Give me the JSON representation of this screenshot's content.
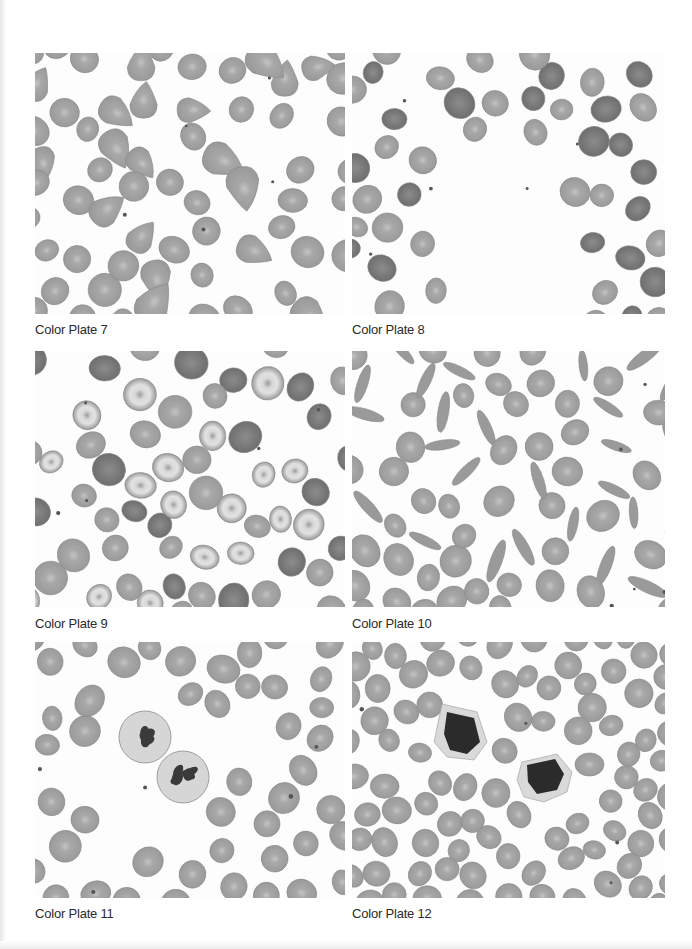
{
  "page": {
    "background": "#ffffff",
    "cell_fill": "#9a9a9a",
    "cell_center": "#c4c4c4",
    "cell_stroke": "#8a8a8a",
    "nucleus_fill": "#3a3a3a"
  },
  "plates": [
    {
      "id": "7",
      "caption": "Color Plate 7",
      "x": 35,
      "y": 53,
      "w": 310,
      "h": 261,
      "cap_y": 322,
      "seed": 7,
      "count": 62,
      "kind": "teardrop"
    },
    {
      "id": "8",
      "caption": "Color Plate 8",
      "x": 352,
      "y": 53,
      "w": 313,
      "h": 261,
      "cap_y": 322,
      "seed": 8,
      "count": 44,
      "kind": "sparse"
    },
    {
      "id": "9",
      "caption": "Color Plate 9",
      "x": 35,
      "y": 351,
      "w": 310,
      "h": 256,
      "cap_y": 616,
      "seed": 9,
      "count": 58,
      "kind": "target"
    },
    {
      "id": "10",
      "caption": "Color Plate 10",
      "x": 352,
      "y": 351,
      "w": 313,
      "h": 256,
      "cap_y": 616,
      "seed": 10,
      "count": 70,
      "kind": "sickle"
    },
    {
      "id": "11",
      "caption": "Color Plate 11",
      "x": 35,
      "y": 642,
      "w": 310,
      "h": 256,
      "cap_y": 906,
      "seed": 11,
      "count": 46,
      "kind": "neutrophil"
    },
    {
      "id": "12",
      "caption": "Color Plate 12",
      "x": 352,
      "y": 642,
      "w": 313,
      "h": 256,
      "cap_y": 906,
      "seed": 12,
      "count": 90,
      "kind": "lymphocyte"
    }
  ]
}
